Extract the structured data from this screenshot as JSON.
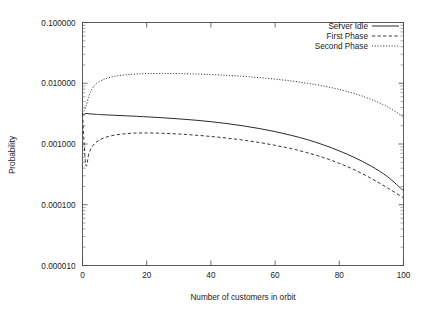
{
  "chart_data": {
    "type": "line",
    "title": "",
    "xlabel": "Number of customers in orbit",
    "ylabel": "Probability",
    "xlim": [
      0,
      100
    ],
    "ylim": [
      1e-05,
      0.1
    ],
    "yscale": "log",
    "grid": false,
    "legend_position": "top-right",
    "xticks": [
      "0",
      "20",
      "40",
      "60",
      "80",
      "100"
    ],
    "xtick_values": [
      0,
      20,
      40,
      60,
      80,
      100
    ],
    "yticks": [
      "0.100000",
      "0.010000",
      "0.001000",
      "0.000100",
      "0.000010"
    ],
    "ytick_values": [
      0.1,
      0.01,
      0.001,
      0.0001,
      1e-05
    ],
    "x": [
      0,
      1,
      2,
      3,
      4,
      5,
      7,
      10,
      13,
      16,
      20,
      25,
      30,
      35,
      40,
      45,
      50,
      55,
      60,
      65,
      70,
      75,
      80,
      85,
      90,
      95,
      100
    ],
    "series": [
      {
        "name": "Server Idle",
        "style": "solid",
        "values": [
          0.003,
          0.00318,
          0.00314,
          0.00311,
          0.00308,
          0.00306,
          0.00302,
          0.00297,
          0.00292,
          0.00287,
          0.0028,
          0.0027,
          0.00259,
          0.00247,
          0.00233,
          0.00217,
          0.00199,
          0.0018,
          0.0016,
          0.00139,
          0.00118,
          0.00097,
          0.00077,
          0.00059,
          0.00043,
          0.00029,
          0.00017
        ]
      },
      {
        "name": "First Phase",
        "style": "dashed",
        "values": [
          0.0031,
          0.00046,
          0.0007,
          0.0009,
          0.00104,
          0.00114,
          0.00128,
          0.0014,
          0.00147,
          0.00151,
          0.00152,
          0.0015,
          0.00146,
          0.0014,
          0.00133,
          0.00125,
          0.00116,
          0.00106,
          0.00095,
          0.00084,
          0.00072,
          0.0006,
          0.00048,
          0.00037,
          0.00027,
          0.00019,
          0.00013
        ]
      },
      {
        "name": "Second Phase",
        "style": "dotted",
        "values": [
          0.00315,
          0.004,
          0.0062,
          0.0081,
          0.0095,
          0.0105,
          0.0118,
          0.013,
          0.0137,
          0.0141,
          0.0144,
          0.0145,
          0.0144,
          0.0142,
          0.0139,
          0.0135,
          0.013,
          0.0124,
          0.0117,
          0.0109,
          0.01,
          0.009,
          0.0079,
          0.0067,
          0.0054,
          0.0041,
          0.0028
        ]
      }
    ]
  },
  "legend": {
    "entries": [
      {
        "label": "Server Idle",
        "style": "solid"
      },
      {
        "label": "First Phase",
        "style": "dashed"
      },
      {
        "label": "Second Phase",
        "style": "dotted"
      }
    ]
  },
  "axes": {
    "x_title": "Number of customers in orbit",
    "y_title": "Probability"
  }
}
